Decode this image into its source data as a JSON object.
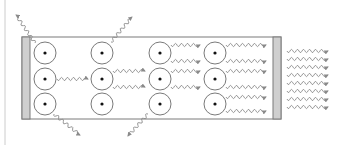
{
  "diagram": {
    "type": "laser-cavity-stimulated-emission",
    "colors": {
      "background": "#ffffff",
      "outline": "#7a7a7a",
      "mirror_fill": "#cfcfcf",
      "photon": "#8a8a8a",
      "atom_dot": "#111111",
      "left_rule": "#cccccc"
    },
    "cavity": {
      "x": 22,
      "y": 37,
      "width": 259,
      "height": 82
    },
    "mirrors": [
      {
        "name": "left-mirror",
        "x": 22,
        "y": 37,
        "width": 8,
        "height": 82
      },
      {
        "name": "right-mirror",
        "x": 273,
        "y": 37,
        "width": 8,
        "height": 82
      }
    ],
    "atoms": [
      {
        "cx": 45,
        "cy": 53
      },
      {
        "cx": 45,
        "cy": 79
      },
      {
        "cx": 45,
        "cy": 104
      },
      {
        "cx": 102,
        "cy": 53
      },
      {
        "cx": 102,
        "cy": 79
      },
      {
        "cx": 102,
        "cy": 104
      },
      {
        "cx": 160,
        "cy": 53
      },
      {
        "cx": 160,
        "cy": 79
      },
      {
        "cx": 160,
        "cy": 104
      },
      {
        "cx": 215,
        "cy": 53
      },
      {
        "cx": 215,
        "cy": 79
      },
      {
        "cx": 215,
        "cy": 104
      }
    ],
    "atom_radius": 11,
    "photons_horizontal": [
      {
        "x1": 57,
        "x2": 88,
        "y": 79
      },
      {
        "x1": 113,
        "x2": 145,
        "y": 71
      },
      {
        "x1": 113,
        "x2": 145,
        "y": 87
      },
      {
        "x1": 171,
        "x2": 200,
        "y": 45
      },
      {
        "x1": 171,
        "x2": 200,
        "y": 61
      },
      {
        "x1": 171,
        "x2": 200,
        "y": 71
      },
      {
        "x1": 171,
        "x2": 200,
        "y": 87
      },
      {
        "x1": 226,
        "x2": 266,
        "y": 45
      },
      {
        "x1": 226,
        "x2": 266,
        "y": 61
      },
      {
        "x1": 226,
        "x2": 266,
        "y": 71
      },
      {
        "x1": 226,
        "x2": 266,
        "y": 87
      },
      {
        "x1": 226,
        "x2": 266,
        "y": 97
      },
      {
        "x1": 226,
        "x2": 266,
        "y": 111
      }
    ],
    "photons_output": [
      {
        "x1": 287,
        "x2": 328,
        "y": 51
      },
      {
        "x1": 287,
        "x2": 328,
        "y": 59
      },
      {
        "x1": 287,
        "x2": 328,
        "y": 67
      },
      {
        "x1": 287,
        "x2": 328,
        "y": 75
      },
      {
        "x1": 287,
        "x2": 328,
        "y": 83
      },
      {
        "x1": 287,
        "x2": 328,
        "y": 91
      },
      {
        "x1": 287,
        "x2": 328,
        "y": 99
      },
      {
        "x1": 287,
        "x2": 328,
        "y": 107
      }
    ],
    "photons_escaping": [
      {
        "from": [
          35,
          43
        ],
        "to": [
          16,
          15
        ]
      },
      {
        "from": [
          111,
          42
        ],
        "to": [
          132,
          17
        ]
      },
      {
        "from": [
          54,
          114
        ],
        "to": [
          80,
          135
        ]
      },
      {
        "from": [
          148,
          114
        ],
        "to": [
          128,
          136
        ]
      }
    ]
  }
}
